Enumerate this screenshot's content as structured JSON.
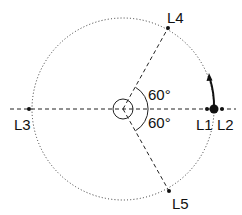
{
  "diagram": {
    "colors": {
      "ink": "#111111",
      "background": "#ffffff"
    },
    "center": {
      "x": 123,
      "y": 109
    },
    "orbit_radius": 91,
    "points": [
      {
        "id": "L1",
        "label": "L1",
        "x": 207,
        "y": 109,
        "label_x": 196,
        "label_y": 130
      },
      {
        "id": "L2",
        "label": "L2",
        "x": 222,
        "y": 109,
        "label_x": 217,
        "label_y": 130
      },
      {
        "id": "L3",
        "label": "L3",
        "x": 29,
        "y": 109,
        "label_x": 14,
        "label_y": 130
      },
      {
        "id": "L4",
        "label": "L4",
        "x": 168,
        "y": 28,
        "label_x": 167,
        "label_y": 23
      },
      {
        "id": "L5",
        "label": "L5",
        "x": 169,
        "y": 191,
        "label_x": 172,
        "label_y": 209
      }
    ],
    "angles": [
      {
        "label": "60°",
        "x": 148,
        "y": 100
      },
      {
        "label": "60°",
        "x": 148,
        "y": 128
      }
    ],
    "secondary_body": {
      "x": 214,
      "y": 109,
      "r": 4.5
    }
  }
}
